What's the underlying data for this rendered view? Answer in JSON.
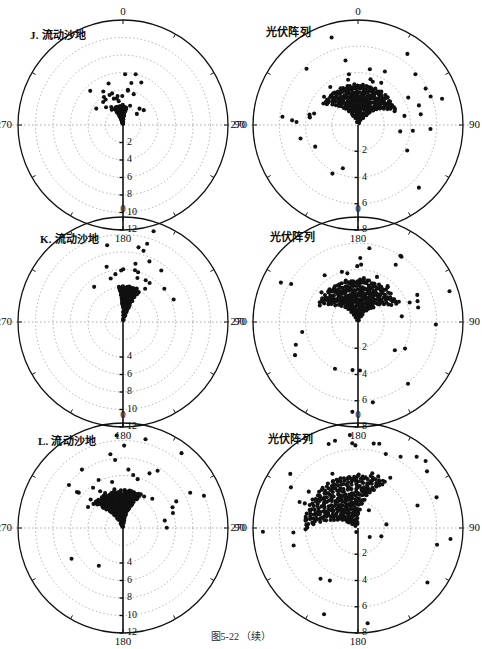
{
  "figure": {
    "caption": "图5-22 （续）",
    "width": 482,
    "height": 642,
    "background": "#ffffff",
    "ink_color": "#111111",
    "grid_color": "#9a9a9a",
    "point_color": "#111111"
  },
  "chart_data": {
    "type": "scatter",
    "projection": "polar",
    "title": "图5-22 （续）",
    "shared": {
      "angular_unit": "degrees",
      "angular_ticks": [
        0,
        90,
        180,
        270
      ],
      "angular_tick_labels": [
        "0",
        "90",
        "180",
        "270"
      ],
      "angular_zero_location": "N",
      "angular_direction": "clockwise",
      "radial_axis_orientation": "down (toward 180)",
      "grid": "dotted concentric circles + dotted cross axes",
      "legend": "none",
      "xlabel": "",
      "ylabel": ""
    },
    "panels": [
      {
        "id": "J-left",
        "row": 1,
        "column": "left",
        "label": "J.",
        "title": "J. 流动沙地",
        "rlim": [
          0,
          12
        ],
        "radial_ticks": [
          2,
          4,
          6,
          8,
          10,
          12
        ],
        "radial_tick_labels": [
          "2",
          "4",
          "6",
          "8",
          "10",
          "12"
        ],
        "n_points": 250,
        "cluster_center_deg": 352,
        "cluster_spread_deg": 34,
        "cluster_r_max": 2.0,
        "description": "Dense arc-banded cluster confined to r<2, centred just west of 0°"
      },
      {
        "id": "J-right",
        "row": 1,
        "column": "right",
        "label": "",
        "title": "光伏阵列",
        "rlim": [
          0,
          8
        ],
        "radial_ticks": [
          2,
          4,
          6,
          8
        ],
        "radial_tick_labels": [
          "2",
          "4",
          "6",
          "8"
        ],
        "n_points": 330,
        "cluster_center_deg": 5,
        "cluster_spread_deg": 115,
        "cluster_r_max": 3.0,
        "description": "Broad fan of concentric arcs spanning roughly 260°–110°, scattered outliers to r≈6"
      },
      {
        "id": "K-left",
        "row": 2,
        "column": "left",
        "label": "K.",
        "title": "K. 流动沙地",
        "rlim": [
          0,
          12
        ],
        "radial_ticks": [
          4,
          6,
          8,
          10,
          12
        ],
        "radial_tick_labels": [
          "4",
          "6",
          "8",
          "10",
          "12"
        ],
        "n_points": 190,
        "cluster_center_deg": 10,
        "cluster_spread_deg": 30,
        "cluster_r_max": 4.0,
        "description": "Narrow elongated cluster of stacked arcs leaning slightly east of 0°"
      },
      {
        "id": "K-right",
        "row": 2,
        "column": "right",
        "label": "",
        "title": "光伏阵列",
        "rlim": [
          0,
          8
        ],
        "radial_ticks": [
          2,
          4,
          6,
          8
        ],
        "radial_tick_labels": [
          "2",
          "4",
          "6",
          "8"
        ],
        "n_points": 320,
        "cluster_center_deg": 0,
        "cluster_spread_deg": 120,
        "cluster_r_max": 3.2,
        "description": "Dense nested-arc cluster around the pole with wide halo of outliers out to r≈6"
      },
      {
        "id": "L-left",
        "row": 3,
        "column": "left",
        "label": "L.",
        "title": "L. 流动沙地",
        "rlim": [
          0,
          12
        ],
        "radial_ticks": [
          4,
          6,
          8,
          10,
          12
        ],
        "radial_tick_labels": [
          "4",
          "6",
          "8",
          "10",
          "12"
        ],
        "n_points": 300,
        "cluster_center_deg": 350,
        "cluster_spread_deg": 70,
        "cluster_r_max": 4.2,
        "description": "Wide triangular fan of arcs opening toward 0°, widest near r≈3–4"
      },
      {
        "id": "L-right",
        "row": 3,
        "column": "right",
        "label": "",
        "title": "光伏阵列",
        "rlim": [
          0,
          8
        ],
        "radial_ticks": [
          2,
          4,
          6,
          8
        ],
        "radial_tick_labels": [
          "2",
          "4",
          "6",
          "8"
        ],
        "n_points": 340,
        "cluster_center_deg": 330,
        "cluster_spread_deg": 110,
        "cluster_r_max": 4.0,
        "description": "Spiral of nested arcs skewed toward the 300°–350° sector, outliers to r≈6"
      }
    ]
  },
  "panels_layout": [
    {
      "key": "J-left",
      "cx": 123,
      "cy": 125,
      "r": 105,
      "title_x": 30,
      "title_y": 26
    },
    {
      "key": "J-right",
      "cx": 358,
      "cy": 125,
      "r": 105,
      "title_x": 266,
      "title_y": 23
    },
    {
      "key": "K-left",
      "cx": 123,
      "cy": 322,
      "r": 105,
      "title_x": 40,
      "title_y": 230
    },
    {
      "key": "K-right",
      "cx": 358,
      "cy": 322,
      "r": 105,
      "title_x": 270,
      "title_y": 228
    },
    {
      "key": "L-left",
      "cx": 123,
      "cy": 528,
      "r": 105,
      "title_x": 38,
      "title_y": 432
    },
    {
      "key": "L-right",
      "cx": 358,
      "cy": 528,
      "r": 105,
      "title_x": 268,
      "title_y": 430
    }
  ]
}
